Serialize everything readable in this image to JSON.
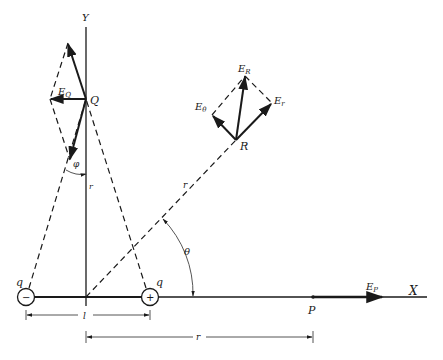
{
  "diagram": {
    "axes": {
      "x_label": "X",
      "y_label": "Y"
    },
    "charges": {
      "negative": {
        "label": "q",
        "sign": "−"
      },
      "positive": {
        "label": "q",
        "sign": "+"
      }
    },
    "points": {
      "Q": {
        "label": "Q",
        "field_label": "E",
        "field_sub": "Q"
      },
      "R": {
        "label": "R",
        "field_label": "E",
        "field_sub": "R",
        "radial_label": "E",
        "radial_sub": "r",
        "theta_label": "E",
        "theta_sub": "θ"
      },
      "P": {
        "label": "P",
        "field_label": "E",
        "field_sub": "P"
      }
    },
    "angles": {
      "phi": "φ",
      "theta": "θ"
    },
    "distances": {
      "r_vertical": "r",
      "r_diagonal": "r",
      "l": "l",
      "r_horizontal": "r"
    },
    "colors": {
      "ink": "#1a1a1a",
      "background": "#ffffff"
    }
  }
}
